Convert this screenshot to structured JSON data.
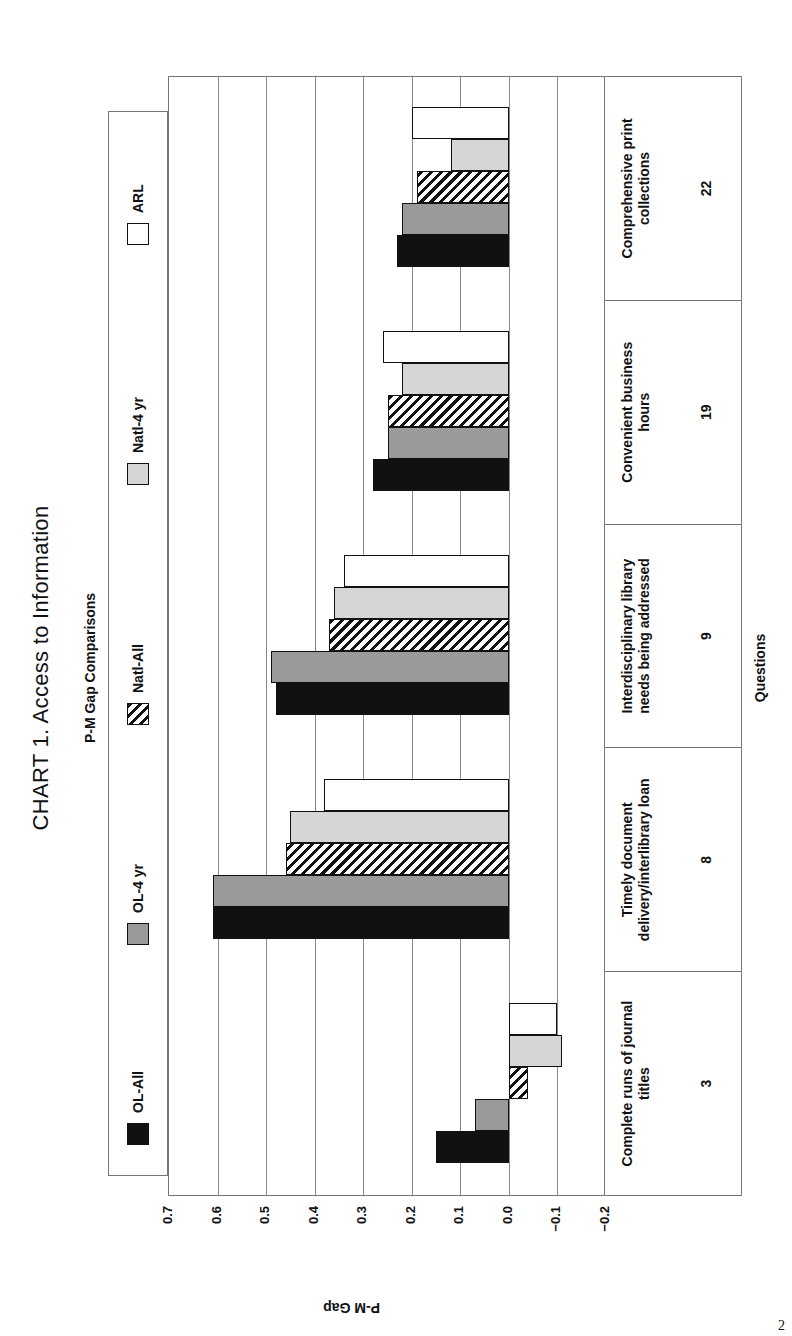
{
  "page_number": "2",
  "chart_data": {
    "type": "bar",
    "orientation": "vertical bars, page rotated 90° counter-clockwise",
    "title": "CHART 1. Access to Information",
    "subtitle": "P-M Gap Comparisons",
    "xlabel": "Questions",
    "ylabel": "P-M Gap",
    "ylim": [
      -0.2,
      0.7
    ],
    "yticks": [
      "0.7",
      "0.6",
      "0.5",
      "0.4",
      "0.3",
      "0.2",
      "0.1",
      "0.0",
      "−0.1",
      "−0.2"
    ],
    "grid": true,
    "legend_position": "top",
    "categories": [
      {
        "label": "Complete runs of journal titles",
        "number": "3"
      },
      {
        "label": "Timely document delivery/interlibrary loan",
        "number": "8"
      },
      {
        "label": "Interdisciplinary library needs being addressed",
        "number": "9"
      },
      {
        "label": "Convenient business hours",
        "number": "19"
      },
      {
        "label": "Comprehensive print collections",
        "number": "22"
      }
    ],
    "series": [
      {
        "name": "OL-All",
        "pattern": "solid-black",
        "color": "#111111",
        "values": [
          0.15,
          0.61,
          0.48,
          0.28,
          0.23
        ]
      },
      {
        "name": "OL-4 yr",
        "pattern": "dark-gray",
        "color": "#9a9a9a",
        "values": [
          0.07,
          0.61,
          0.49,
          0.25,
          0.22
        ]
      },
      {
        "name": "Natl-All",
        "pattern": "diagonal-hatch",
        "color": "#ffffff",
        "values": [
          -0.04,
          0.46,
          0.37,
          0.25,
          0.19
        ]
      },
      {
        "name": "Natl-4 yr",
        "pattern": "light-gray",
        "color": "#d6d6d6",
        "values": [
          -0.11,
          0.45,
          0.36,
          0.22,
          0.12
        ]
      },
      {
        "name": "ARL",
        "pattern": "white",
        "color": "#ffffff",
        "values": [
          -0.1,
          0.38,
          0.34,
          0.26,
          0.2
        ]
      }
    ]
  }
}
